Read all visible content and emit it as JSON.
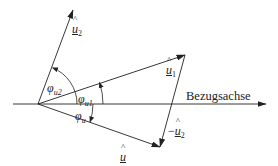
{
  "diagram": {
    "type": "phasor-diagram",
    "reference_axis": {
      "label": "Bezugsachse"
    },
    "vectors": [
      {
        "id": "u_hat",
        "symbol": "u",
        "hat": "^",
        "label_display": "û",
        "underlined": true
      },
      {
        "id": "u1_hat",
        "symbol": "u",
        "subscript": "1",
        "hat": "^",
        "label_display": "û1",
        "underlined": true
      },
      {
        "id": "u2_hat",
        "symbol": "u",
        "subscript": "2",
        "hat": "^",
        "label_display": "û2",
        "underlined": true
      },
      {
        "id": "neg_u2_hat",
        "prefix": "−",
        "symbol": "u",
        "subscript": "2",
        "hat": "^",
        "label_display": "−û2",
        "underlined": true
      }
    ],
    "angles": [
      {
        "id": "phi_u",
        "symbol": "φ",
        "subscript": "u"
      },
      {
        "id": "phi_u1",
        "symbol": "φ",
        "subscript": "u1"
      },
      {
        "id": "phi_u2",
        "symbol": "φ",
        "subscript": "u2"
      }
    ],
    "colors": {
      "line": "#222222",
      "background": "#ffffff"
    }
  }
}
